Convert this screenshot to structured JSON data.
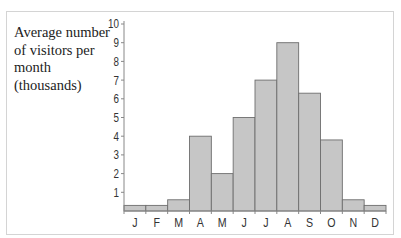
{
  "chart_data": {
    "type": "bar",
    "title": "Average number of visitors per month (thousands)",
    "title_lines": [
      "Average number",
      "of visitors per",
      "month",
      "(thousands)"
    ],
    "xlabel": "",
    "ylabel": "Average number of visitors per month (thousands)",
    "categories": [
      "J",
      "F",
      "M",
      "A",
      "M",
      "J",
      "J",
      "A",
      "S",
      "O",
      "N",
      "D"
    ],
    "values": [
      0.3,
      0.3,
      0.6,
      4,
      2,
      5,
      7,
      9,
      6.3,
      3.8,
      0.6,
      0.3
    ],
    "ylim": [
      0,
      10
    ],
    "yticks": [
      1,
      2,
      3,
      4,
      5,
      6,
      7,
      8,
      9,
      10
    ],
    "grid": false,
    "legend": "none",
    "colors": {
      "bar_fill": "#c6c6c6",
      "bar_stroke": "#6e6e6e",
      "axis": "#888888",
      "frame": "#d4d4d4"
    }
  }
}
